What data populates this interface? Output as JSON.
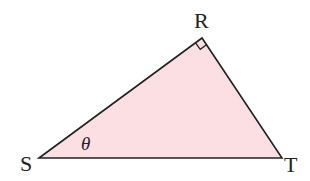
{
  "diagram": {
    "type": "right-triangle",
    "fill_color": "#fbdfe3",
    "stroke_color": "#222222",
    "vertices": [
      {
        "name": "S",
        "x": 39,
        "y": 158
      },
      {
        "name": "R",
        "x": 202,
        "y": 38
      },
      {
        "name": "T",
        "x": 282,
        "y": 158
      }
    ],
    "right_angle_at": "R",
    "labels": {
      "S": "S",
      "R": "R",
      "T": "T",
      "angle_at_S": "θ"
    }
  }
}
